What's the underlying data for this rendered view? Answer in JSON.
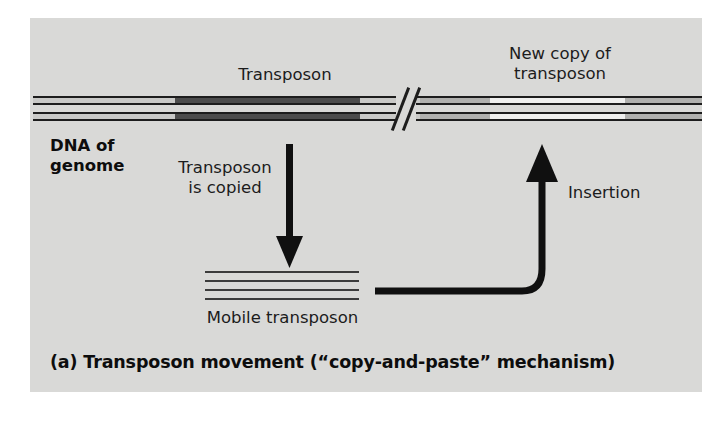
{
  "figure": {
    "caption": "(a) Transposon movement (“copy-and-paste” mechanism)",
    "background_color": "#ffffff",
    "panel_color": "#d9d9d7"
  },
  "labels": {
    "transposon": "Transposon",
    "new_copy_line1": "New copy of",
    "new_copy_line2": "transposon",
    "dna_of_line1": "DNA of",
    "dna_of_line2": "genome",
    "copied_line1": "Transposon",
    "copied_line2": "is copied",
    "insertion": "Insertion",
    "mobile_transposon": "Mobile transposon"
  },
  "colors": {
    "ink": "#1d1d1d",
    "transposon_dark": "#4c4c4c",
    "flank_light": "#c9c9c7",
    "flank_medium": "#b0b0ae",
    "new_copy_light": "#efefee",
    "panel": "#d9d9d7"
  },
  "diagram": {
    "type": "biology-process-diagram",
    "topic": "DNA transposon copy-and-paste transposition",
    "dna_upper_strand": {
      "y": 96,
      "segments": [
        {
          "name": "left-flank",
          "x": 33,
          "width": 142,
          "fill": "#c9c9c7"
        },
        {
          "name": "transposon",
          "x": 175,
          "width": 185,
          "fill": "#4c4c4c"
        },
        {
          "name": "right-of-transposon",
          "x": 360,
          "width": 36,
          "fill": "#c9c9c7"
        },
        {
          "name": "after-break-flank",
          "x": 420,
          "width": 70,
          "fill": "#b0b0ae"
        },
        {
          "name": "new-copy-of-transposon",
          "x": 490,
          "width": 135,
          "fill": "#efefee"
        },
        {
          "name": "far-right-flank",
          "x": 625,
          "width": 74,
          "fill": "#b0b0ae"
        }
      ]
    },
    "dna_lower_strand": {
      "y": 112,
      "segments": [
        {
          "name": "left-flank",
          "x": 33,
          "width": 142,
          "fill": "#c9c9c7"
        },
        {
          "name": "transposon",
          "x": 175,
          "width": 185,
          "fill": "#4c4c4c"
        },
        {
          "name": "right-of-transposon",
          "x": 360,
          "width": 36,
          "fill": "#c9c9c7"
        },
        {
          "name": "after-break-flank",
          "x": 420,
          "width": 70,
          "fill": "#b0b0ae"
        },
        {
          "name": "new-copy-of-transposon",
          "x": 490,
          "width": 135,
          "fill": "#efefee"
        },
        {
          "name": "far-right-flank",
          "x": 625,
          "width": 74,
          "fill": "#b0b0ae"
        }
      ]
    },
    "break_symbol": {
      "name": "double-slash-break",
      "x": 396,
      "width": 26
    },
    "mobile_transposon_lines": 4,
    "arrows": [
      {
        "name": "transposon-is-copied-arrow",
        "direction": "down",
        "from": [
          289,
          148
        ],
        "to": [
          289,
          258
        ]
      },
      {
        "name": "insertion-arrow",
        "direction": "curved-up-right",
        "from": [
          378,
          291
        ],
        "to": [
          536,
          143
        ]
      }
    ]
  }
}
